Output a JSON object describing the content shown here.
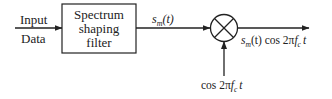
{
  "diagram": {
    "input_label_top": "Input",
    "input_label_bottom": "Data",
    "filter_block": {
      "line1": "Spectrum",
      "line2": "shaping",
      "line3": "filter"
    },
    "filter_output_signal": "s_m(t)",
    "filter_output_signal_parts": {
      "s": "s",
      "sub": "m",
      "arg": "(t)"
    },
    "mixer_symbol": "multiplier",
    "carrier_label": "cos 2πf_c t",
    "carrier_label_parts": {
      "pre": "cos 2π",
      "f": "f",
      "sub": "c",
      "t": "t"
    },
    "output_label": "s_m(t) cos 2πf_c t",
    "output_label_parts": {
      "s": "s",
      "sub": "m",
      "arg": "(t) cos 2π",
      "f": "f",
      "fsub": "c",
      "t": "t"
    }
  },
  "colors": {
    "stroke": "#222222",
    "background": "#ffffff"
  }
}
